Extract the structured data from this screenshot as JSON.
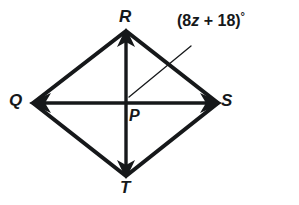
{
  "figure": {
    "type": "geometry-diagram",
    "shape_name": "quadrilateral-QRST",
    "background_color": "#ffffff",
    "stroke_color": "#16181a",
    "vertices": [
      {
        "id": "R",
        "label": "R",
        "x": 126,
        "y": 31,
        "role": "top-vertex"
      },
      {
        "id": "Q",
        "label": "Q",
        "x": 33,
        "y": 103,
        "role": "left-vertex"
      },
      {
        "id": "S",
        "label": "S",
        "x": 218,
        "y": 103,
        "role": "right-vertex"
      },
      {
        "id": "T",
        "label": "T",
        "x": 126,
        "y": 176,
        "role": "bottom-vertex"
      },
      {
        "id": "P",
        "label": "P",
        "x": 126,
        "y": 103,
        "role": "diagonal-intersection"
      }
    ],
    "sides": [
      {
        "from": "Q",
        "to": "R"
      },
      {
        "from": "R",
        "to": "S"
      },
      {
        "from": "S",
        "to": "T"
      },
      {
        "from": "T",
        "to": "Q"
      }
    ],
    "diagonals": [
      {
        "from": "R",
        "to": "T",
        "orientation": "vertical",
        "arrowheads": [
          "R",
          "T"
        ]
      },
      {
        "from": "Q",
        "to": "S",
        "orientation": "horizontal",
        "arrowheads": [
          "Q",
          "S"
        ]
      }
    ],
    "annotations": [
      {
        "id": "angle-RPS",
        "text": "(8z + 18)°",
        "expression_prefix": "(8",
        "variable": "z",
        "operator": "+",
        "constant": "18",
        "suffix": ")",
        "degree_symbol": "°",
        "targets_angle": "RPS",
        "leader_from": {
          "x": 129,
          "y": 97
        },
        "leader_to": {
          "x": 191,
          "y": 46
        }
      }
    ]
  },
  "labels": {
    "R": "R",
    "Q": "Q",
    "S": "S",
    "T": "T",
    "P": "P"
  },
  "angle_label": {
    "full": "(8z + 18)°",
    "open_paren": "(",
    "coefficient": "8",
    "variable": "z",
    "operator": "+",
    "constant": "18",
    "close_paren": ")",
    "degree": "°"
  }
}
